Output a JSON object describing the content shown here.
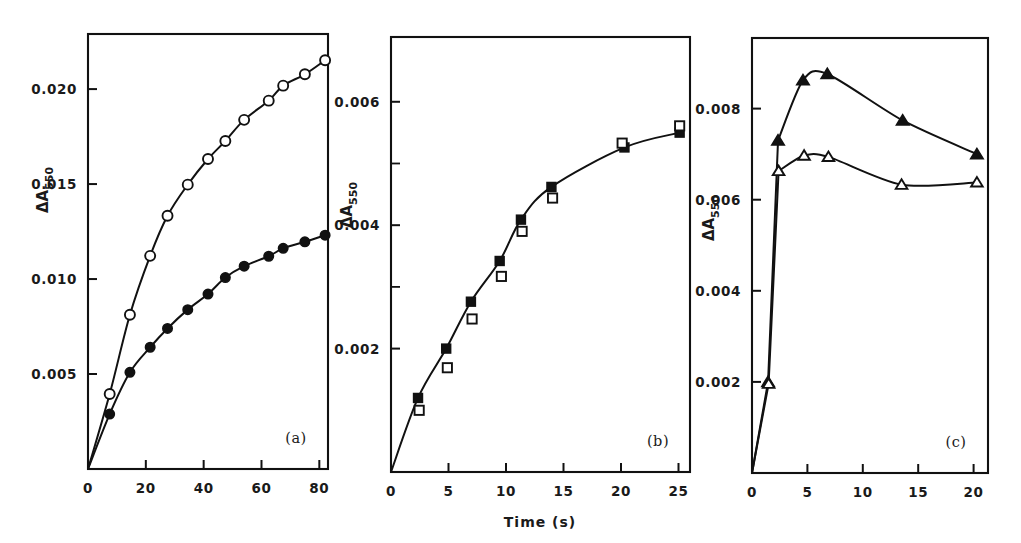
{
  "figure": {
    "background": "#ffffff",
    "ink_color": "#111111",
    "shared_xlabel": "Time (s)",
    "shared_ylabel_main": "ΔA",
    "shared_ylabel_sub": "550"
  },
  "panels": [
    {
      "tag": "(a)",
      "ylabel": "ΔA550",
      "xlabel": "",
      "xticks": [
        0,
        20,
        40,
        60,
        80
      ],
      "xtick_labels": [
        "0",
        "20",
        "40",
        "60",
        "80"
      ],
      "yticks": [
        0.005,
        0.01,
        0.015,
        0.02
      ],
      "ytick_labels": [
        "0.005",
        "0.010",
        "0.015",
        "0.020"
      ],
      "xlim": [
        0,
        83
      ],
      "ylim": [
        0,
        0.0229
      ]
    },
    {
      "tag": "(b)",
      "ylabel": "ΔA550",
      "xlabel": "Time (s)",
      "xticks": [
        0,
        5,
        10,
        15,
        20,
        25
      ],
      "xtick_labels": [
        "0",
        "5",
        "10",
        "15",
        "20",
        "25"
      ],
      "yticks": [
        0.002,
        0.004,
        0.006
      ],
      "ytick_labels": [
        "0.002",
        "0.004",
        "0.006"
      ],
      "yticks_minor": [
        0.003,
        0.005
      ],
      "xlim": [
        0,
        26
      ],
      "ylim": [
        0,
        0.00705
      ]
    },
    {
      "tag": "(c)",
      "ylabel": "ΔA550",
      "xlabel": "",
      "xticks": [
        0,
        5,
        10,
        15,
        20
      ],
      "xtick_labels": [
        "0",
        "5",
        "10",
        "15",
        "20"
      ],
      "yticks": [
        0.002,
        0.004,
        0.006,
        0.008
      ],
      "ytick_labels": [
        "0.002",
        "0.004",
        "0.006",
        "0.008"
      ],
      "xlim": [
        0,
        21.3
      ],
      "ylim": [
        0,
        0.00955
      ]
    }
  ],
  "chart_data": [
    {
      "type": "scatter",
      "panel": "(a)",
      "title": "",
      "xlabel": "",
      "ylabel": "ΔA550",
      "xlim": [
        0,
        83
      ],
      "ylim": [
        0,
        0.0229
      ],
      "grid": false,
      "legend": "none",
      "series": [
        {
          "name": "open-circles",
          "marker": "open-circle",
          "x": [
            7.5,
            14.5,
            21.5,
            27.5,
            34.5,
            41.5,
            47.5,
            54.0,
            62.5,
            67.5,
            75.0,
            82.0
          ],
          "y": [
            0.00395,
            0.00812,
            0.01122,
            0.01333,
            0.01497,
            0.01632,
            0.01727,
            0.01838,
            0.01939,
            0.02018,
            0.02078,
            0.02152
          ]
        },
        {
          "name": "filled-circles",
          "marker": "filled-circle",
          "x": [
            7.5,
            14.5,
            21.5,
            27.5,
            34.5,
            41.5,
            47.5,
            54.0,
            62.5,
            67.5,
            75.0,
            82.0
          ],
          "y": [
            0.00289,
            0.00509,
            0.00641,
            0.0074,
            0.00839,
            0.00921,
            0.01008,
            0.01068,
            0.0112,
            0.01162,
            0.01196,
            0.01231
          ]
        }
      ]
    },
    {
      "type": "scatter",
      "panel": "(b)",
      "title": "",
      "xlabel": "Time (s)",
      "ylabel": "ΔA550",
      "xlim": [
        0,
        26
      ],
      "ylim": [
        0,
        0.00705
      ],
      "grid": false,
      "legend": "none",
      "series": [
        {
          "name": "filled-squares",
          "marker": "filled-square",
          "x": [
            2.35,
            4.8,
            6.95,
            9.45,
            11.3,
            13.95,
            20.3,
            25.1
          ],
          "y": [
            0.0012,
            0.002,
            0.00276,
            0.00342,
            0.00409,
            0.00462,
            0.00526,
            0.0055
          ]
        },
        {
          "name": "open-squares",
          "marker": "open-square",
          "x": [
            2.45,
            4.9,
            7.05,
            9.6,
            11.4,
            14.05,
            20.1,
            25.1
          ],
          "y": [
            0.001,
            0.00169,
            0.00248,
            0.00317,
            0.0039,
            0.00444,
            0.00533,
            0.00561
          ]
        }
      ]
    },
    {
      "type": "scatter",
      "panel": "(c)",
      "title": "",
      "xlabel": "",
      "ylabel": "ΔA550",
      "xlim": [
        0,
        21.3
      ],
      "ylim": [
        0,
        0.00955
      ],
      "grid": false,
      "legend": "none",
      "series": [
        {
          "name": "filled-triangles",
          "marker": "filled-triangle",
          "x": [
            1.45,
            2.35,
            4.6,
            6.8,
            13.6,
            20.3
          ],
          "y": [
            0.002,
            0.0073,
            0.00862,
            0.00876,
            0.00774,
            0.007
          ]
        },
        {
          "name": "open-triangles",
          "marker": "open-triangle",
          "x": [
            1.5,
            2.4,
            4.7,
            6.9,
            13.5,
            20.3
          ],
          "y": [
            0.00196,
            0.00663,
            0.00697,
            0.00694,
            0.00633,
            0.00638
          ]
        }
      ]
    }
  ]
}
